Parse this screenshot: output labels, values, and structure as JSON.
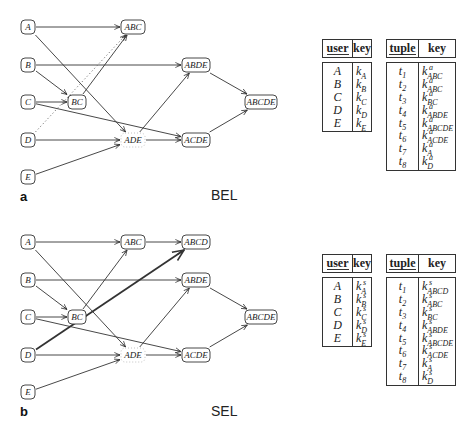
{
  "panels": [
    {
      "id": "a",
      "letter": "a",
      "name": "BEL",
      "graph": {
        "nodes": [
          {
            "id": "A",
            "label": "A",
            "x": 28,
            "y": 27,
            "w": 14,
            "style": "solid"
          },
          {
            "id": "B",
            "label": "B",
            "x": 28,
            "y": 65,
            "w": 14,
            "style": "solid"
          },
          {
            "id": "C",
            "label": "C",
            "x": 28,
            "y": 102,
            "w": 14,
            "style": "solid"
          },
          {
            "id": "D",
            "label": "D",
            "x": 28,
            "y": 140,
            "w": 14,
            "style": "solid"
          },
          {
            "id": "E",
            "label": "E",
            "x": 28,
            "y": 177,
            "w": 14,
            "style": "solid"
          },
          {
            "id": "ABC",
            "label": "ABC",
            "x": 133,
            "y": 27,
            "w": 24,
            "style": "solid"
          },
          {
            "id": "BC",
            "label": "BC",
            "x": 77,
            "y": 102,
            "w": 18,
            "style": "solid"
          },
          {
            "id": "ADE",
            "label": "ADE",
            "x": 133,
            "y": 140,
            "w": 24,
            "style": "dashed"
          },
          {
            "id": "ABDE",
            "label": "ABDE",
            "x": 196,
            "y": 65,
            "w": 28,
            "style": "solid"
          },
          {
            "id": "ACDE",
            "label": "ACDE",
            "x": 196,
            "y": 140,
            "w": 28,
            "style": "solid"
          },
          {
            "id": "ABCDE",
            "label": "ABCDE",
            "x": 261,
            "y": 102,
            "w": 32,
            "style": "solid"
          }
        ],
        "edges": [
          {
            "from": "A",
            "to": "ABC",
            "style": "solid"
          },
          {
            "from": "A",
            "to": "ADE",
            "style": "solid"
          },
          {
            "from": "B",
            "to": "ABDE",
            "style": "solid"
          },
          {
            "from": "B",
            "to": "BC",
            "style": "solid"
          },
          {
            "from": "C",
            "to": "BC",
            "style": "solid"
          },
          {
            "from": "C",
            "to": "ACDE",
            "style": "solid"
          },
          {
            "from": "D",
            "to": "ABC",
            "style": "dotted"
          },
          {
            "from": "D",
            "to": "ADE",
            "style": "solid"
          },
          {
            "from": "E",
            "to": "ADE",
            "style": "solid"
          },
          {
            "from": "BC",
            "to": "ABC",
            "style": "solid"
          },
          {
            "from": "ADE",
            "to": "ABDE",
            "style": "solid"
          },
          {
            "from": "ADE",
            "to": "ACDE",
            "style": "solid"
          },
          {
            "from": "ABDE",
            "to": "ABCDE",
            "style": "solid"
          },
          {
            "from": "ACDE",
            "to": "ABCDE",
            "style": "solid"
          }
        ]
      },
      "user_table": {
        "headers": [
          "user",
          "key"
        ],
        "rows": [
          {
            "user": "A",
            "key": "k",
            "sup": "",
            "sub": "A"
          },
          {
            "user": "B",
            "key": "k",
            "sup": "",
            "sub": "B"
          },
          {
            "user": "C",
            "key": "k",
            "sup": "",
            "sub": "C"
          },
          {
            "user": "D",
            "key": "k",
            "sup": "",
            "sub": "D"
          },
          {
            "user": "E",
            "key": "k",
            "sup": "",
            "sub": "E"
          }
        ]
      },
      "tuple_table": {
        "headers": [
          "tuple",
          "key"
        ],
        "rows": [
          {
            "tuple": "t",
            "tsub": "1",
            "key": "k",
            "sup": "a",
            "sub": "ABC"
          },
          {
            "tuple": "t",
            "tsub": "2",
            "key": "k",
            "sup": "a",
            "sub": "ABC"
          },
          {
            "tuple": "t",
            "tsub": "3",
            "key": "k",
            "sup": "a",
            "sub": "BC"
          },
          {
            "tuple": "t",
            "tsub": "4",
            "key": "k",
            "sup": "a",
            "sub": "ABDE"
          },
          {
            "tuple": "t",
            "tsub": "5",
            "key": "k",
            "sup": "a",
            "sub": "ABCDE"
          },
          {
            "tuple": "t",
            "tsub": "6",
            "key": "k",
            "sup": "a",
            "sub": "ACDE"
          },
          {
            "tuple": "t",
            "tsub": "7",
            "key": "k",
            "sup": "a",
            "sub": "A"
          },
          {
            "tuple": "t",
            "tsub": "8",
            "key": "k",
            "sup": "a",
            "sub": "D"
          }
        ]
      }
    },
    {
      "id": "b",
      "letter": "b",
      "name": "SEL",
      "graph": {
        "nodes": [
          {
            "id": "A",
            "label": "A",
            "x": 28,
            "y": 27,
            "w": 14,
            "style": "solid"
          },
          {
            "id": "B",
            "label": "B",
            "x": 28,
            "y": 65,
            "w": 14,
            "style": "solid"
          },
          {
            "id": "C",
            "label": "C",
            "x": 28,
            "y": 102,
            "w": 14,
            "style": "solid"
          },
          {
            "id": "D",
            "label": "D",
            "x": 28,
            "y": 140,
            "w": 14,
            "style": "solid"
          },
          {
            "id": "E",
            "label": "E",
            "x": 28,
            "y": 177,
            "w": 14,
            "style": "solid"
          },
          {
            "id": "ABC",
            "label": "ABC",
            "x": 133,
            "y": 27,
            "w": 24,
            "style": "solid"
          },
          {
            "id": "ABCD",
            "label": "ABCD",
            "x": 196,
            "y": 27,
            "w": 28,
            "style": "solid"
          },
          {
            "id": "BC",
            "label": "BC",
            "x": 77,
            "y": 102,
            "w": 18,
            "style": "solid"
          },
          {
            "id": "ADE",
            "label": "ADE",
            "x": 133,
            "y": 140,
            "w": 24,
            "style": "dashed"
          },
          {
            "id": "ABDE",
            "label": "ABDE",
            "x": 196,
            "y": 65,
            "w": 28,
            "style": "solid"
          },
          {
            "id": "ACDE",
            "label": "ACDE",
            "x": 196,
            "y": 140,
            "w": 28,
            "style": "solid"
          },
          {
            "id": "ABCDE",
            "label": "ABCDE",
            "x": 261,
            "y": 102,
            "w": 32,
            "style": "solid"
          }
        ],
        "edges": [
          {
            "from": "A",
            "to": "ABC",
            "style": "solid"
          },
          {
            "from": "A",
            "to": "ADE",
            "style": "solid"
          },
          {
            "from": "ABC",
            "to": "ABCD",
            "style": "solid"
          },
          {
            "from": "B",
            "to": "ABDE",
            "style": "solid"
          },
          {
            "from": "B",
            "to": "BC",
            "style": "solid"
          },
          {
            "from": "C",
            "to": "BC",
            "style": "solid"
          },
          {
            "from": "C",
            "to": "ACDE",
            "style": "solid"
          },
          {
            "from": "D",
            "to": "ABCD",
            "style": "thick"
          },
          {
            "from": "D",
            "to": "ADE",
            "style": "solid"
          },
          {
            "from": "E",
            "to": "ADE",
            "style": "solid"
          },
          {
            "from": "BC",
            "to": "ABC",
            "style": "solid"
          },
          {
            "from": "ADE",
            "to": "ABDE",
            "style": "solid"
          },
          {
            "from": "ADE",
            "to": "ACDE",
            "style": "solid"
          },
          {
            "from": "ABDE",
            "to": "ABCDE",
            "style": "solid"
          },
          {
            "from": "ACDE",
            "to": "ABCDE",
            "style": "solid"
          }
        ]
      },
      "user_table": {
        "headers": [
          "user",
          "key"
        ],
        "rows": [
          {
            "user": "A",
            "key": "k",
            "sup": "s",
            "sub": "A"
          },
          {
            "user": "B",
            "key": "k",
            "sup": "s",
            "sub": "B"
          },
          {
            "user": "C",
            "key": "k",
            "sup": "s",
            "sub": "C"
          },
          {
            "user": "D",
            "key": "k",
            "sup": "s",
            "sub": "D"
          },
          {
            "user": "E",
            "key": "k",
            "sup": "s",
            "sub": "E"
          }
        ]
      },
      "tuple_table": {
        "headers": [
          "tuple",
          "key"
        ],
        "rows": [
          {
            "tuple": "t",
            "tsub": "1",
            "key": "k",
            "sup": "s",
            "sub": "ABCD"
          },
          {
            "tuple": "t",
            "tsub": "2",
            "key": "k",
            "sup": "s",
            "sub": "ABC"
          },
          {
            "tuple": "t",
            "tsub": "3",
            "key": "k",
            "sup": "s",
            "sub": "BC"
          },
          {
            "tuple": "t",
            "tsub": "4",
            "key": "k",
            "sup": "s",
            "sub": "ABDE"
          },
          {
            "tuple": "t",
            "tsub": "5",
            "key": "k",
            "sup": "s",
            "sub": "ABCDE"
          },
          {
            "tuple": "t",
            "tsub": "6",
            "key": "k",
            "sup": "s",
            "sub": "ACDE"
          },
          {
            "tuple": "t",
            "tsub": "7",
            "key": "k",
            "sup": "s",
            "sub": "A"
          },
          {
            "tuple": "t",
            "tsub": "8",
            "key": "k",
            "sup": "s",
            "sub": "D"
          }
        ]
      }
    }
  ]
}
